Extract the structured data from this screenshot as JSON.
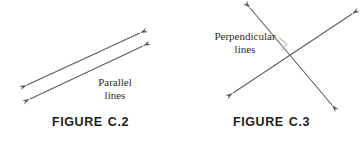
{
  "figures": [
    {
      "id": "parallel",
      "caption_word": "FIGURE",
      "caption_number": "C.2",
      "caption_full": "FIGURE  C.2",
      "label_line1": "Parallel",
      "label_line2": "lines",
      "line_color": "#5c5c5c",
      "lines": [
        {
          "name": "upper-parallel-line",
          "x1": 27,
          "y1": 85,
          "x2": 140,
          "y2": 33,
          "double_arrow": true
        },
        {
          "name": "lower-parallel-line",
          "x1": 30,
          "y1": 99,
          "x2": 143,
          "y2": 46,
          "double_arrow": true
        }
      ]
    },
    {
      "id": "perpendicular",
      "caption_word": "FIGURE",
      "caption_number": "C.3",
      "caption_full": "FIGURE  C.3",
      "label_line1": "Perpendicular",
      "label_line2": "lines",
      "line_color": "#5c5c5c",
      "right_angle_marker": true,
      "lines": [
        {
          "name": "falling-perpendicular-line",
          "x1": 69,
          "y1": 8,
          "x2": 151,
          "y2": 105,
          "double_arrow": true
        },
        {
          "name": "rising-perpendicular-line",
          "x1": 52,
          "y1": 93,
          "x2": 171,
          "y2": 14,
          "double_arrow": true
        }
      ]
    }
  ],
  "background_color": "#ffffff"
}
